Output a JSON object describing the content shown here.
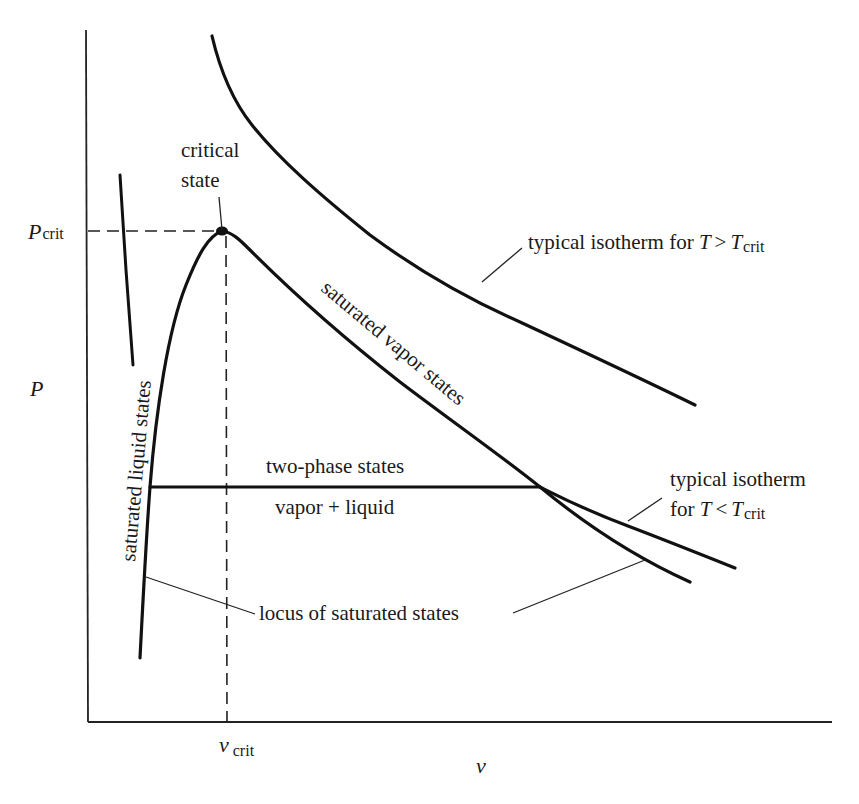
{
  "diagram": {
    "type": "P-v phase diagram",
    "axes": {
      "y_label": "P",
      "x_label": "v",
      "y_tick": {
        "main": "P",
        "sub": "crit"
      },
      "x_tick": {
        "main": "v",
        "sub": "crit"
      }
    },
    "labels": {
      "critical_state_line1": "critical",
      "critical_state_line2": "state",
      "isotherm_above": {
        "text": "typical isotherm for ",
        "T": "T",
        "op": ">",
        "T2": "T",
        "sub": "crit"
      },
      "isotherm_below_line1": "typical isotherm",
      "isotherm_below_line2": {
        "text": "for ",
        "T": "T",
        "op": "<",
        "T2": "T",
        "sub": "crit"
      },
      "saturated_vapor": "saturated vapor states",
      "saturated_liquid": "saturated liquid states",
      "two_phase": "two-phase states",
      "vapor_liquid": "vapor + liquid",
      "locus": "locus of saturated states"
    },
    "colors": {
      "background": "#ffffff",
      "ink": "#111111"
    }
  }
}
